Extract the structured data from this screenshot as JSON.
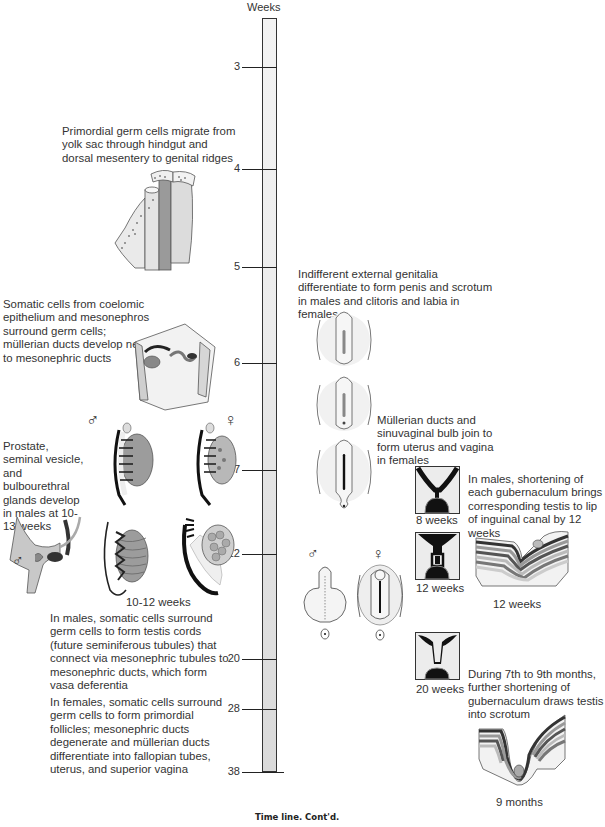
{
  "timeline": {
    "axis_label": "Weeks",
    "ticks": [
      {
        "label": "3",
        "y": 67
      },
      {
        "label": "4",
        "y": 169
      },
      {
        "label": "5",
        "y": 267
      },
      {
        "label": "6",
        "y": 363
      },
      {
        "label": "7",
        "y": 470
      },
      {
        "label": "12",
        "y": 554
      },
      {
        "label": "20",
        "y": 659
      },
      {
        "label": "28",
        "y": 709
      },
      {
        "label": "38",
        "y": 772
      }
    ]
  },
  "left_annotations": {
    "primordial_germ_cells": "Primordial germ cells migrate from yolk sac through hindgut and dorsal mesentery to genital ridges",
    "somatic_cells": "Somatic cells from coelomic epithelium and mesonephros surround germ cells; müllerian ducts develop next to mesonephric ducts",
    "prostate": "Prostate, seminal vesicle, and bulbourethral glands develop in males at 10-13 weeks",
    "gonad_age_label": "10-12 weeks",
    "males_testis": "In males, somatic cells surround germ cells to form testis cords (future seminiferous tubules) that connect via mesonephric tubules to mesonephric ducts, which form vasa deferentia",
    "females_follicles": "In females, somatic cells surround germ cells to form primordial follicles; mesonephric ducts degenerate and müllerian ducts differentiate into fallopian tubes, uterus, and superior vagina"
  },
  "right_annotations": {
    "external_genitalia": "Indifferent external genitalia differentiate to form penis and scrotum in males and clitoris and labia in females",
    "mullerian_ducts": "Müllerian ducts and sinuvaginal bulb join to form uterus and vagina in females",
    "gubernaculum_12": "In males, shortening of each gubernaculum brings corresponding testis to lip of inguinal canal by 12 weeks",
    "gubernaculum_late": "During 7th to 9th months, further shortening of gubernaculum draws testis into scrotum",
    "uterus_8_label": "8 weeks",
    "uterus_12_label": "12 weeks",
    "uterus_20_label": "20 weeks",
    "descent_12_label": "12 weeks",
    "descent_9m_label": "9 months"
  },
  "symbols": {
    "male": "♂",
    "female": "♀"
  },
  "caption": "Time line. Cont'd."
}
